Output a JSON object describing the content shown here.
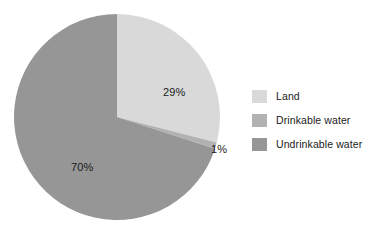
{
  "chart_data": {
    "type": "pie",
    "title": "",
    "categories": [
      "Land",
      "Drinkable water",
      "Undrinkable water"
    ],
    "values": [
      29,
      1,
      70
    ],
    "value_labels": [
      "29%",
      "1%",
      "70%"
    ],
    "units": "percent",
    "total": 100,
    "start_angle_deg": 0,
    "direction": "clockwise",
    "legend_position": "right",
    "grid": false,
    "colors": [
      "#d9d9d9",
      "#b2b2b2",
      "#969696"
    ],
    "background": "#ffffff",
    "series": [
      {
        "name": "Earth surface composition",
        "slices": [
          {
            "label": "Land",
            "value": 29,
            "display": "29%",
            "color": "#d9d9d9",
            "label_placement": "inside"
          },
          {
            "label": "Drinkable water",
            "value": 1,
            "display": "1%",
            "color": "#b2b2b2",
            "label_placement": "outside"
          },
          {
            "label": "Undrinkable water",
            "value": 70,
            "display": "70%",
            "color": "#969696",
            "label_placement": "inside"
          }
        ]
      }
    ]
  },
  "legend": {
    "items": [
      {
        "label": "Land",
        "color": "#d9d9d9"
      },
      {
        "label": "Drinkable water",
        "color": "#b2b2b2"
      },
      {
        "label": "Undrinkable water",
        "color": "#969696"
      }
    ]
  },
  "slice_labels": {
    "land": "29%",
    "drinkable": "1%",
    "undrinkable": "70%"
  }
}
